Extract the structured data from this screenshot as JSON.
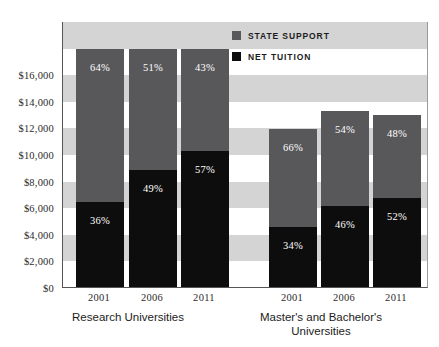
{
  "legend": {
    "items": [
      {
        "label": "STATE SUPPORT",
        "color": "#58585a",
        "key": "state_support"
      },
      {
        "label": "NET TUITION",
        "color": "#0d0d0d",
        "key": "net_tuition"
      }
    ]
  },
  "axis": {
    "y_ticks": [
      "$16,000",
      "$14,000",
      "$12,000",
      "$10,000",
      "$8,000",
      "$6,000",
      "$4,000",
      "$2,000",
      "$0"
    ],
    "y_tick_values": [
      16000,
      14000,
      12000,
      10000,
      8000,
      6000,
      4000,
      2000,
      0
    ]
  },
  "groups": [
    {
      "name": "Research Universities",
      "label_lines": [
        "Research Universities"
      ],
      "years": [
        "2001",
        "2006",
        "2011"
      ]
    },
    {
      "name": "Master's and Bachelor's Universities",
      "label_lines": [
        "Master's and Bachelor's",
        "Universities"
      ],
      "years": [
        "2001",
        "2006",
        "2011"
      ]
    }
  ],
  "bar_labels": {
    "research": {
      "2001": {
        "state_support": "64%",
        "net_tuition": "36%"
      },
      "2006": {
        "state_support": "51%",
        "net_tuition": "49%"
      },
      "2011": {
        "state_support": "43%",
        "net_tuition": "57%"
      }
    },
    "masters": {
      "2001": {
        "state_support": "66%",
        "net_tuition": "34%"
      },
      "2006": {
        "state_support": "54%",
        "net_tuition": "46%"
      },
      "2011": {
        "state_support": "48%",
        "net_tuition": "52%"
      }
    }
  },
  "chart_data": {
    "type": "bar",
    "subtype": "stacked",
    "title": "",
    "xlabel": "",
    "ylabel": "",
    "ylim": [
      0,
      20000
    ],
    "ytick_step": 2000,
    "grid": "horizontal-alternating-bands",
    "legend_position": "top-right",
    "categories": [
      "Research Universities 2001",
      "Research Universities 2006",
      "Research Universities 2011",
      "Master's and Bachelor's Universities 2001",
      "Master's and Bachelor's Universities 2006",
      "Master's and Bachelor's Universities 2011"
    ],
    "series": [
      {
        "name": "NET TUITION",
        "color": "#0d0d0d",
        "values": [
          6400,
          8800,
          10200,
          4500,
          6100,
          6700
        ],
        "percent_labels": [
          "36%",
          "49%",
          "57%",
          "34%",
          "46%",
          "52%"
        ]
      },
      {
        "name": "STATE SUPPORT",
        "color": "#58585a",
        "values": [
          11500,
          9100,
          7700,
          7400,
          7100,
          6200
        ],
        "percent_labels": [
          "64%",
          "51%",
          "43%",
          "66%",
          "54%",
          "48%"
        ]
      }
    ],
    "totals": [
      17900,
      17900,
      17900,
      11900,
      13200,
      12900
    ]
  },
  "colors": {
    "state_support": "#58585a",
    "net_tuition": "#0d0d0d",
    "band_gray": "#d4d4d4",
    "band_white": "#ffffff",
    "axis": "#555555",
    "text": "#1c1c1c"
  }
}
